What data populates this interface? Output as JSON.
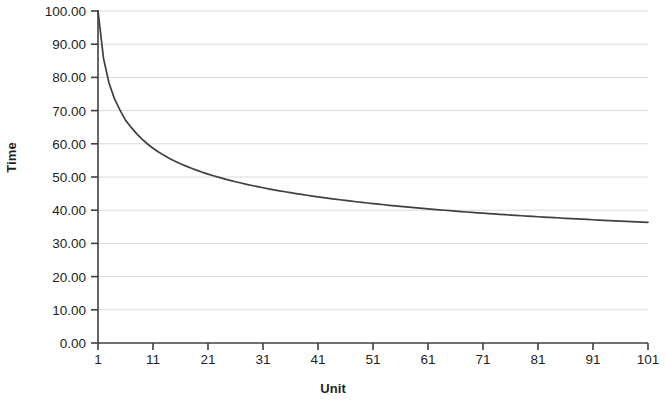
{
  "chart_data": {
    "type": "line",
    "title": "",
    "xlabel": "Unit",
    "ylabel": "Time",
    "xlim": [
      1,
      101
    ],
    "ylim": [
      0,
      100
    ],
    "grid": true,
    "grid_axis": "y",
    "legend": "none",
    "y_ticks": [
      "100.00",
      "90.00",
      "80.00",
      "70.00",
      "60.00",
      "50.00",
      "40.00",
      "30.00",
      "20.00",
      "10.00",
      "0.00"
    ],
    "y_tick_values": [
      100,
      90,
      80,
      70,
      60,
      50,
      40,
      30,
      20,
      10,
      0
    ],
    "x_ticks": [
      "1",
      "11",
      "21",
      "31",
      "41",
      "51",
      "61",
      "71",
      "81",
      "91",
      "101"
    ],
    "x_tick_values": [
      1,
      11,
      21,
      31,
      41,
      51,
      61,
      71,
      81,
      91,
      101
    ],
    "series": [
      {
        "name": "Time per unit",
        "color": "#404040",
        "x": [
          1,
          2,
          3,
          4,
          5,
          6,
          7,
          8,
          9,
          10,
          11,
          12,
          13,
          14,
          15,
          16,
          17,
          18,
          19,
          20,
          21,
          22,
          23,
          24,
          25,
          26,
          27,
          28,
          29,
          30,
          31,
          32,
          33,
          34,
          35,
          36,
          37,
          38,
          39,
          40,
          41,
          42,
          43,
          44,
          45,
          46,
          47,
          48,
          49,
          50,
          51,
          52,
          53,
          54,
          55,
          56,
          57,
          58,
          59,
          60,
          61,
          62,
          63,
          64,
          65,
          66,
          67,
          68,
          69,
          70,
          71,
          72,
          73,
          74,
          75,
          76,
          77,
          78,
          79,
          80,
          81,
          82,
          83,
          84,
          85,
          86,
          87,
          88,
          89,
          90,
          91,
          92,
          93,
          94,
          95,
          96,
          97,
          98,
          99,
          100,
          101
        ],
        "values": [
          100.0,
          85.75,
          78.3,
          73.53,
          70.12,
          67.13,
          65.01,
          63.05,
          61.38,
          59.94,
          58.67,
          57.54,
          56.52,
          55.6,
          54.76,
          53.99,
          53.27,
          52.61,
          51.99,
          51.41,
          50.87,
          50.36,
          49.88,
          49.42,
          48.99,
          48.57,
          48.18,
          47.8,
          47.44,
          47.1,
          46.76,
          46.44,
          46.14,
          45.84,
          45.55,
          45.28,
          45.01,
          44.75,
          44.5,
          44.26,
          44.02,
          43.79,
          43.57,
          43.35,
          43.14,
          42.94,
          42.74,
          42.54,
          42.35,
          42.17,
          41.99,
          41.81,
          41.64,
          41.47,
          41.31,
          41.15,
          40.99,
          40.83,
          40.68,
          40.54,
          40.39,
          40.25,
          40.11,
          39.98,
          39.85,
          39.72,
          39.59,
          39.46,
          39.34,
          39.22,
          39.1,
          38.99,
          38.87,
          38.76,
          38.65,
          38.54,
          38.44,
          38.33,
          38.23,
          38.13,
          38.03,
          37.93,
          37.84,
          37.74,
          37.65,
          37.56,
          37.47,
          37.38,
          37.3,
          37.21,
          37.13,
          37.04,
          36.96,
          36.88,
          36.8,
          36.73,
          36.65,
          36.57,
          36.5,
          36.43,
          36.35
        ]
      }
    ]
  },
  "plot": {
    "axis_color": "#404040",
    "grid_color": "#d9d9d9",
    "line_color": "#404040",
    "background": "#ffffff"
  }
}
